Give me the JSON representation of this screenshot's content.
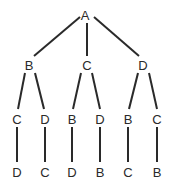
{
  "diagram": {
    "type": "tree",
    "colors": {
      "line": "#2a2a2a",
      "text": "#2a2a2a",
      "background": "#ffffff"
    },
    "nodes": [
      {
        "id": "n0",
        "label": "A",
        "x": 85,
        "y": 15
      },
      {
        "id": "n1",
        "label": "B",
        "x": 29,
        "y": 65
      },
      {
        "id": "n2",
        "label": "C",
        "x": 87,
        "y": 65
      },
      {
        "id": "n3",
        "label": "D",
        "x": 143,
        "y": 65
      },
      {
        "id": "n4",
        "label": "C",
        "x": 17,
        "y": 119
      },
      {
        "id": "n5",
        "label": "D",
        "x": 45,
        "y": 119
      },
      {
        "id": "n6",
        "label": "B",
        "x": 72,
        "y": 119
      },
      {
        "id": "n7",
        "label": "D",
        "x": 100,
        "y": 119
      },
      {
        "id": "n8",
        "label": "B",
        "x": 128,
        "y": 119
      },
      {
        "id": "n9",
        "label": "C",
        "x": 157,
        "y": 119
      },
      {
        "id": "n10",
        "label": "D",
        "x": 17,
        "y": 172
      },
      {
        "id": "n11",
        "label": "C",
        "x": 45,
        "y": 172
      },
      {
        "id": "n12",
        "label": "D",
        "x": 72,
        "y": 172
      },
      {
        "id": "n13",
        "label": "B",
        "x": 100,
        "y": 172
      },
      {
        "id": "n14",
        "label": "C",
        "x": 128,
        "y": 172
      },
      {
        "id": "n15",
        "label": "B",
        "x": 157,
        "y": 172
      }
    ],
    "edges": [
      {
        "from": "n0",
        "to": "n1",
        "x1": 80,
        "y1": 17,
        "x2": 34,
        "y2": 56
      },
      {
        "from": "n0",
        "to": "n2",
        "x1": 87,
        "y1": 23,
        "x2": 87,
        "y2": 56
      },
      {
        "from": "n0",
        "to": "n3",
        "x1": 94,
        "y1": 17,
        "x2": 139,
        "y2": 56
      },
      {
        "from": "n1",
        "to": "n4",
        "x1": 25,
        "y1": 73,
        "x2": 18,
        "y2": 109
      },
      {
        "from": "n1",
        "to": "n5",
        "x1": 35,
        "y1": 73,
        "x2": 44,
        "y2": 109
      },
      {
        "from": "n2",
        "to": "n6",
        "x1": 81,
        "y1": 73,
        "x2": 73,
        "y2": 109
      },
      {
        "from": "n2",
        "to": "n7",
        "x1": 92,
        "y1": 73,
        "x2": 100,
        "y2": 109
      },
      {
        "from": "n3",
        "to": "n8",
        "x1": 138,
        "y1": 73,
        "x2": 129,
        "y2": 109
      },
      {
        "from": "n3",
        "to": "n9",
        "x1": 149,
        "y1": 73,
        "x2": 157,
        "y2": 109
      },
      {
        "from": "n4",
        "to": "n10",
        "x1": 17,
        "y1": 127,
        "x2": 17,
        "y2": 162
      },
      {
        "from": "n5",
        "to": "n11",
        "x1": 45,
        "y1": 127,
        "x2": 45,
        "y2": 162
      },
      {
        "from": "n6",
        "to": "n12",
        "x1": 72,
        "y1": 127,
        "x2": 72,
        "y2": 162
      },
      {
        "from": "n7",
        "to": "n13",
        "x1": 100,
        "y1": 127,
        "x2": 100,
        "y2": 162
      },
      {
        "from": "n8",
        "to": "n14",
        "x1": 128,
        "y1": 127,
        "x2": 128,
        "y2": 162
      },
      {
        "from": "n9",
        "to": "n15",
        "x1": 157,
        "y1": 127,
        "x2": 157,
        "y2": 162
      }
    ]
  }
}
